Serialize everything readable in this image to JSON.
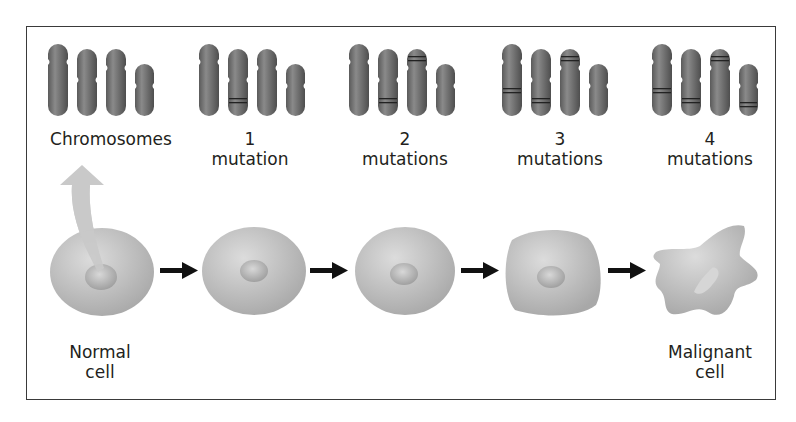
{
  "stages": [
    {
      "number": "",
      "label": "Chromosomes",
      "mutated_bands": []
    },
    {
      "number": "1",
      "label": "mutation",
      "mutated_bands": [
        1
      ]
    },
    {
      "number": "2",
      "label": "mutations",
      "mutated_bands": [
        1,
        2
      ]
    },
    {
      "number": "3",
      "label": "mutations",
      "mutated_bands": [
        0,
        1,
        2
      ]
    },
    {
      "number": "4",
      "label": "mutations",
      "mutated_bands": [
        0,
        1,
        2,
        3
      ]
    }
  ],
  "cells": {
    "first_label_line1": "Normal",
    "first_label_line2": "cell",
    "last_label_line1": "Malignant",
    "last_label_line2": "cell"
  },
  "colors": {
    "chromosome": "#6e6e6e",
    "cell": "#bdbdbd",
    "arrow": "#111111",
    "pointer_arrow": "#c8c8c8",
    "frame": "#3a3a3a"
  }
}
